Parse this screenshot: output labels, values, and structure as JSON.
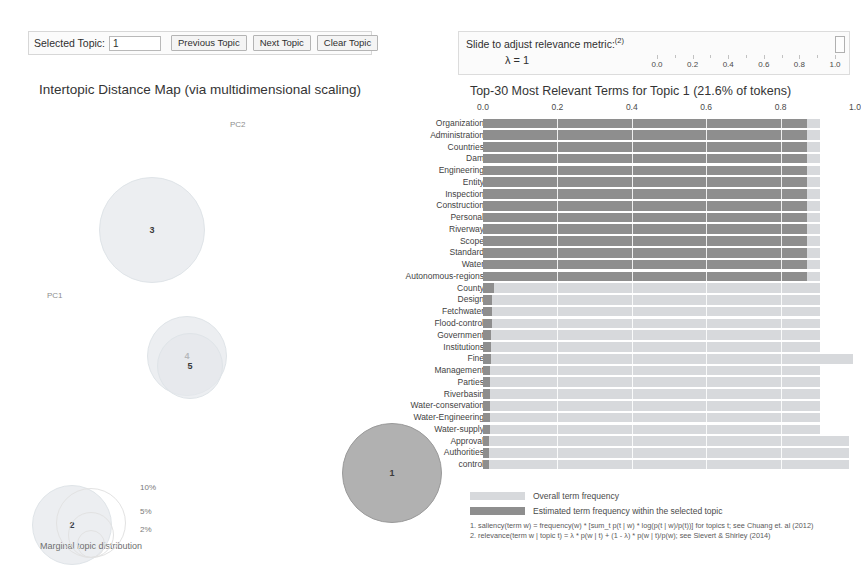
{
  "controls": {
    "selected_topic_label": "Selected Topic:",
    "selected_topic_value": "1",
    "previous_topic_label": "Previous Topic",
    "next_topic_label": "Next Topic",
    "clear_topic_label": "Clear Topic"
  },
  "slider": {
    "caption": "Slide to adjust relevance metric:",
    "caption_superscript": "(2)",
    "lambda_text": "λ = 1",
    "value": 1.0,
    "min": 0.0,
    "max": 1.0,
    "tick_labels": [
      "0.0",
      "0.2",
      "0.4",
      "0.6",
      "0.8",
      "1.0"
    ]
  },
  "intertopic_map": {
    "title": "Intertopic Distance Map (via multidimensional scaling)",
    "axis_labels": {
      "x": "PC1",
      "y": "PC2"
    },
    "marginal_label": "Marginal topic distribution",
    "size_legend": [
      "2%",
      "5%",
      "10%"
    ],
    "topics": [
      {
        "id": "3",
        "cx": 152,
        "cy": 152,
        "r": 53,
        "selected": false
      },
      {
        "id": "4",
        "cx": 187,
        "cy": 278,
        "r": 40,
        "selected": false
      },
      {
        "id": "5",
        "cx": 190,
        "cy": 288,
        "r": 33,
        "selected": false
      },
      {
        "id": "2",
        "cx": 72,
        "cy": 447,
        "r": 40,
        "selected": false
      },
      {
        "id": "1",
        "cx": 392,
        "cy": 395,
        "r": 50,
        "selected": true
      }
    ]
  },
  "chart_data": {
    "type": "bar",
    "title": "Top-30 Most Relevant Terms for Topic 1 (21.6% of tokens)",
    "xlabel": "",
    "ylabel": "",
    "xlim": [
      0.0,
      1.0
    ],
    "tick_labels": [
      "0.0",
      "0.2",
      "0.4",
      "0.6",
      "0.8",
      "1.0"
    ],
    "ticks": [
      0.0,
      0.2,
      0.4,
      0.6,
      0.8,
      1.0
    ],
    "grid": true,
    "legend_position": "bottom",
    "orientation": "horizontal",
    "topic": "1",
    "topic_token_share": "21.6%",
    "categories": [
      "Organization",
      "Administration",
      "Countries",
      "Dam",
      "Engineering",
      "Entity",
      "Inspection",
      "Construction",
      "Personal",
      "Riverway",
      "Scope",
      "Standard",
      "Water",
      "Autonomous-regions",
      "County",
      "Design",
      "Fetchwater",
      "Flood-control",
      "Government",
      "Institutions",
      "Fine",
      "Management",
      "Parties",
      "Riverbasin",
      "Water-conservation",
      "Water-Engineering",
      "Water-supply",
      "Approval",
      "Authorities",
      "control"
    ],
    "series": [
      {
        "name": "Overall term frequency",
        "color": "#d7d9dc",
        "values": [
          0.905,
          0.905,
          0.905,
          0.905,
          0.905,
          0.905,
          0.905,
          0.905,
          0.905,
          0.905,
          0.905,
          0.905,
          0.905,
          0.905,
          0.905,
          0.905,
          0.905,
          0.905,
          0.905,
          0.905,
          0.995,
          0.905,
          0.905,
          0.905,
          0.905,
          0.905,
          0.905,
          0.985,
          0.985,
          0.985
        ]
      },
      {
        "name": "Estimated term frequency within the selected topic",
        "color": "#8e8e8e",
        "values": [
          0.87,
          0.87,
          0.87,
          0.87,
          0.87,
          0.87,
          0.87,
          0.87,
          0.87,
          0.87,
          0.87,
          0.87,
          0.87,
          0.87,
          0.03,
          0.025,
          0.025,
          0.025,
          0.022,
          0.022,
          0.022,
          0.02,
          0.02,
          0.02,
          0.02,
          0.018,
          0.018,
          0.015,
          0.015,
          0.015
        ]
      }
    ]
  },
  "legend": {
    "overall_label": "Overall term frequency",
    "estimated_label": "Estimated term frequency within the selected topic"
  },
  "footnotes": [
    "1. saliency(term w) = frequency(w) * [sum_t p(t | w) * log(p(t | w)/p(t))] for topics t; see Chuang et. al (2012)",
    "2. relevance(term w | topic t) = λ * p(w | t) + (1 - λ) * p(w | t)/p(w); see Sievert & Shirley (2014)"
  ]
}
